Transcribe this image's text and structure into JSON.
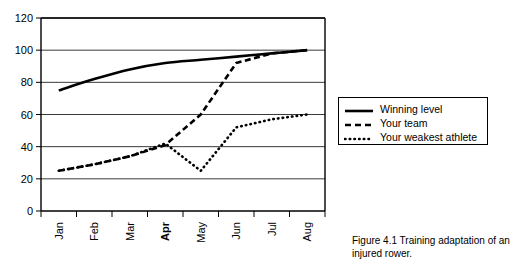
{
  "chart_data": {
    "type": "line",
    "title": "",
    "xlabel": "",
    "ylabel": "",
    "categories": [
      "Jan",
      "Feb",
      "Mar",
      "Apr",
      "May",
      "Jun",
      "Jul",
      "Aug"
    ],
    "bold_categories": [
      "Apr"
    ],
    "ylim": [
      0,
      120
    ],
    "y_ticks": [
      0,
      20,
      40,
      60,
      80,
      100,
      120
    ],
    "grid": true,
    "legend_position": "right",
    "series": [
      {
        "name": "Winning level",
        "style": "solid",
        "x": [
          "Jan",
          "Feb",
          "Mar",
          "Apr",
          "May",
          "Jun",
          "Jul",
          "Aug"
        ],
        "values": [
          75,
          82,
          88,
          92,
          94,
          96,
          98,
          100
        ]
      },
      {
        "name": "Your team",
        "style": "dashed",
        "x": [
          "Jan",
          "Feb",
          "Mar",
          "Apr",
          "May",
          "Jun",
          "Jul",
          "Aug"
        ],
        "values": [
          25,
          29,
          34,
          41,
          60,
          92,
          98,
          100
        ]
      },
      {
        "name": "Your weakest athlete",
        "style": "dotted",
        "x": [
          "Jan",
          "Feb",
          "Mar",
          "Apr",
          "May",
          "Jun",
          "Jul",
          "Aug"
        ],
        "values": [
          25,
          29,
          34,
          42,
          25,
          52,
          57,
          60
        ]
      }
    ]
  },
  "legend": {
    "items": [
      {
        "label": "Winning level",
        "style": "solid"
      },
      {
        "label": "Your team",
        "style": "dashed"
      },
      {
        "label": "Your weakest athlete",
        "style": "dotted"
      }
    ]
  },
  "caption": {
    "text": "Figure 4.1 Training adaptation of an injured rower."
  },
  "colors": {
    "line": "#000000",
    "grid": "#3a3a3a",
    "axis": "#000000",
    "background": "#ffffff"
  }
}
